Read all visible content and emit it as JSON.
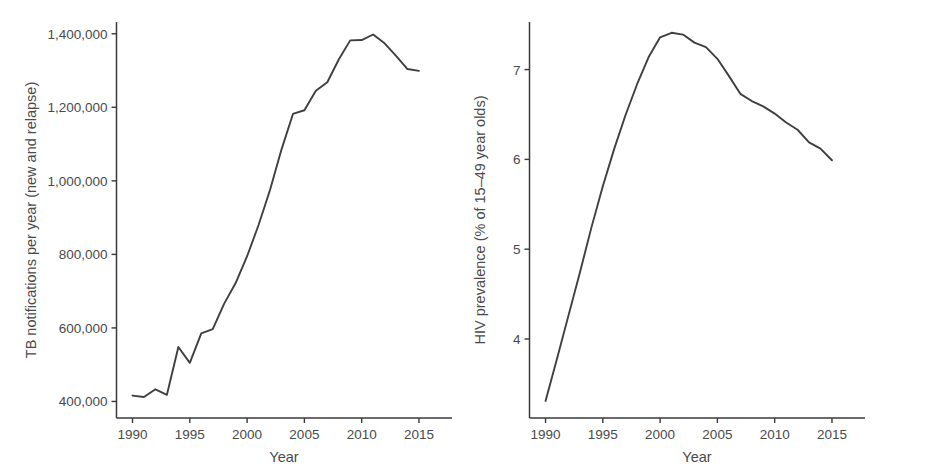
{
  "figure": {
    "title": "",
    "background": "#ffffff",
    "line_color": "#3f3f3f",
    "axis_color": "#3a3a3a",
    "text_color": "#4a4a4a",
    "panel_count": 2
  },
  "chart_data": [
    {
      "id": "tb-notifications",
      "type": "line",
      "title": "",
      "xlabel": "Year",
      "ylabel": "TB notifications per year (new and relapse)",
      "xlim": [
        1988.6,
        2016.4
      ],
      "ylim": [
        355000,
        1432000
      ],
      "xticks": [
        1990,
        1995,
        2000,
        2005,
        2010,
        2015
      ],
      "xticklabels": [
        "1990",
        "1995",
        "2000",
        "2005",
        "2010",
        "2015"
      ],
      "yticks": [
        400000,
        600000,
        800000,
        1000000,
        1200000,
        1400000
      ],
      "yticklabels": [
        "400,000",
        "600,000",
        "800,000",
        "1,000,000",
        "1,200,000",
        "1,400,000"
      ],
      "grid": false,
      "legend": false,
      "x": [
        1990,
        1991,
        1992,
        1993,
        1994,
        1995,
        1996,
        1997,
        1998,
        1999,
        2000,
        2001,
        2002,
        2003,
        2004,
        2005,
        2006,
        2007,
        2008,
        2009,
        2010,
        2011,
        2012,
        2013,
        2014,
        2015
      ],
      "values": [
        416000,
        412000,
        433000,
        418000,
        548000,
        505000,
        585000,
        597000,
        666000,
        722000,
        795000,
        880000,
        975000,
        1085000,
        1182000,
        1192000,
        1245000,
        1268000,
        1330000,
        1382000,
        1383000,
        1398000,
        1374000,
        1340000,
        1304000,
        1299000
      ]
    },
    {
      "id": "hiv-prevalence",
      "type": "line",
      "title": "",
      "xlabel": "Year",
      "ylabel": "HIV prevalence (% of 15–49 year olds)",
      "xlim": [
        1988.6,
        2016.4
      ],
      "ylim": [
        3.12,
        7.53
      ],
      "xticks": [
        1990,
        1995,
        2000,
        2005,
        2010,
        2015
      ],
      "xticklabels": [
        "1990",
        "1995",
        "2000",
        "2005",
        "2010",
        "2015"
      ],
      "yticks": [
        4,
        5,
        6,
        7
      ],
      "yticklabels": [
        "4",
        "5",
        "6",
        "7"
      ],
      "grid": false,
      "legend": false,
      "x": [
        1990,
        1991,
        1992,
        1993,
        1994,
        1995,
        1996,
        1997,
        1998,
        1999,
        2000,
        2001,
        2002,
        2003,
        2004,
        2005,
        2006,
        2007,
        2008,
        2009,
        2010,
        2011,
        2012,
        2013,
        2014,
        2015
      ],
      "values": [
        3.31,
        3.78,
        4.26,
        4.74,
        5.24,
        5.7,
        6.12,
        6.5,
        6.84,
        7.14,
        7.36,
        7.41,
        7.39,
        7.3,
        7.25,
        7.12,
        6.93,
        6.73,
        6.65,
        6.59,
        6.51,
        6.41,
        6.33,
        6.19,
        6.12,
        5.99
      ]
    }
  ]
}
